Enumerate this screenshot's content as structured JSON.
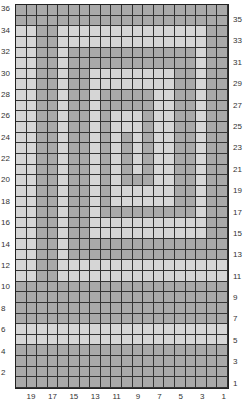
{
  "chart": {
    "columns": 20,
    "rows": 36,
    "colors": {
      "M": "#a9a9a9",
      "L": "#d6d6d6"
    },
    "left_labels": [
      "36",
      "34",
      "32",
      "30",
      "28",
      "26",
      "24",
      "22",
      "20",
      "18",
      "16",
      "14",
      "12",
      "10",
      "8",
      "6",
      "4",
      "2"
    ],
    "right_labels": [
      "35",
      "33",
      "31",
      "29",
      "27",
      "25",
      "23",
      "21",
      "19",
      "17",
      "15",
      "13",
      "11",
      "9",
      "7",
      "5",
      "3",
      "1"
    ],
    "bottom_labels": [
      "19",
      "17",
      "15",
      "13",
      "11",
      "9",
      "7",
      "5",
      "3",
      "1"
    ],
    "pattern": [
      "MMMMMMMMMMMMMMMMMMMM",
      "MMMMMMMMMMMMMMMMMMMM",
      "LLMMLLLLLLLLLLLLLLMM",
      "LLMMLLLLLLLLLLLLLLMM",
      "LLMMLMMMMMMMMMMMMLMM",
      "LLMMLMMMMMMMMMMMMLMM",
      "LLMMLMMLLLLLLLLMMLMM",
      "LLMMLMMLLLLLLLLMMLMM",
      "LLMMLMMLMMMMMLLMMLMM",
      "LLMMLMMLMMMMMLLMMLMM",
      "LLMMLMMLMLLLMLLMMLMM",
      "LLMMLMMLMLLLMLLMMLMM",
      "LLMMLMMLMLMLMLLMMLMM",
      "LLMMLMMLMLMLMLLMMLMM",
      "LLMMLMMLMLMLMLLMMLMM",
      "LLMMLMMLMLMLMLLMMLMM",
      "LLMMLMMLMLMMMLLMMLMM",
      "LLMMLMMLMLLLLLLMMLMM",
      "LLMMLMMLMLLLLLLMMLMM",
      "LLMMLMMLMMMMMMMMMLMM",
      "LLMMLMMLLLLLLLLLLLMM",
      "LLMMLMMLLLLLLLLLLLMM",
      "LLMMLMMMMMMMMMMMMMMM",
      "LLMMLMMMMMMMMMMMMMMM",
      "LLMMLLLLLLLLLLLLLLLL",
      "LLMMLLLLLLLLLLLLLLLL",
      "MMMMMMMMMMMMMMMMMMMM",
      "MMMMMMMMMMMMMMMMMMMM",
      "MMMMMMMMMMMMMMMMMMMM",
      "MMMMMMMMMMMMMMMMMMMM",
      "LLLLLLLLLLLLLLLLLLLL",
      "LLLLLLLLLLLLLLLLLLLL",
      "MMMMMMMMMMMMMMMMMMMM",
      "MMMMMMMMMMMMMMMMMMMM",
      "MMMMMMMMMMMMMMMMMMMM",
      "MMMMMMMMMMMMMMMMMMMM"
    ]
  }
}
